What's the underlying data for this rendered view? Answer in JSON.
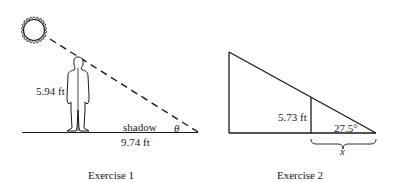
{
  "exercise1": {
    "caption": "Exercise 1",
    "height_label": "5.94 ft",
    "shadow_label": "shadow",
    "shadow_length_label": "9.74 ft",
    "angle_label": "θ",
    "icons": [
      "sun-icon",
      "person-icon"
    ]
  },
  "exercise2": {
    "caption": "Exercise 2",
    "height_label": "5.73 ft",
    "angle_label": "27.5°",
    "unknown_label": "x"
  }
}
